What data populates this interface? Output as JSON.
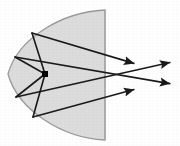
{
  "diagram": {
    "canvas": {
      "width": 180,
      "height": 146
    },
    "colors": {
      "background": "#fefefe",
      "reflector_fill": "#dcdcdc",
      "reflector_stroke": "#9a9a9a",
      "chord_stroke": "#aaaaaa",
      "ray_stroke": "#1a1a1a",
      "focus_fill": "#000000"
    },
    "reflector": {
      "name": "parabolic-mirror",
      "vertex": {
        "x": 8,
        "y": 74
      },
      "top_end": {
        "x": 105,
        "y": 10
      },
      "bottom_end": {
        "x": 105,
        "y": 140
      },
      "chord_x": 105,
      "fill": "#dcdcdc",
      "stroke": "#9a9a9a",
      "stroke_width": 1.3
    },
    "focus": {
      "name": "focal-point",
      "x": 45,
      "y": 74,
      "size": 6,
      "shape": "square"
    },
    "rays": [
      {
        "id": "ray-1",
        "label": "upper incident and reflected ray",
        "incident_from": {
          "x": 45,
          "y": 74
        },
        "reflection_point": {
          "x": 32,
          "y": 33
        },
        "exit_point": {
          "x": 136,
          "y": 64
        },
        "arrow": true
      },
      {
        "id": "ray-2",
        "label": "upper-mid incident and reflected ray",
        "incident_from": {
          "x": 45,
          "y": 74
        },
        "reflection_point": {
          "x": 15,
          "y": 57
        },
        "exit_point": {
          "x": 172,
          "y": 84
        },
        "arrow": true
      },
      {
        "id": "ray-3",
        "label": "lower-mid incident and reflected ray",
        "incident_from": {
          "x": 45,
          "y": 74
        },
        "reflection_point": {
          "x": 16,
          "y": 97
        },
        "exit_point": {
          "x": 172,
          "y": 62
        },
        "arrow": true
      },
      {
        "id": "ray-4",
        "label": "lower incident and reflected ray",
        "incident_from": {
          "x": 45,
          "y": 74
        },
        "reflection_point": {
          "x": 33,
          "y": 117
        },
        "exit_point": {
          "x": 136,
          "y": 89
        },
        "arrow": true
      }
    ],
    "arrowheads": [
      {
        "id": "arrowhead-1",
        "x": 136,
        "y": 64
      },
      {
        "id": "arrowhead-2",
        "x": 172,
        "y": 84
      },
      {
        "id": "arrowhead-3",
        "x": 172,
        "y": 62
      },
      {
        "id": "arrowhead-4",
        "x": 136,
        "y": 89
      }
    ]
  }
}
